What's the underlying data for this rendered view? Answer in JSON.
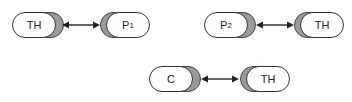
{
  "diagram": {
    "pairs": [
      {
        "left": {
          "label": "TH",
          "sub": ""
        },
        "right": {
          "label": "P",
          "sub": "1"
        },
        "connector": "bidirectional-arrow"
      },
      {
        "left": {
          "label": "P",
          "sub": "2"
        },
        "right": {
          "label": "TH",
          "sub": ""
        },
        "connector": "bidirectional-arrow"
      },
      {
        "left": {
          "label": "C",
          "sub": ""
        },
        "right": {
          "label": "TH",
          "sub": ""
        },
        "connector": "bidirectional-arrow"
      }
    ],
    "colors": {
      "node_fill": "#ffffff",
      "node_shadow": "#9a9a9a",
      "stroke": "#333333"
    }
  }
}
